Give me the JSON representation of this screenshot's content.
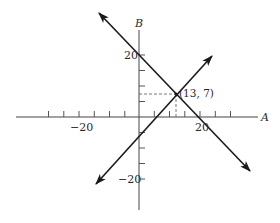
{
  "diagram": {
    "type": "coordinate-graph",
    "axes": {
      "horizontal": {
        "name": "A",
        "tick_step": 5,
        "labeled_ticks": [
          {
            "value": -20,
            "label": "−20"
          },
          {
            "value": 20,
            "label": "20"
          }
        ],
        "range": [
          -40,
          40
        ]
      },
      "vertical": {
        "name": "B",
        "tick_step": 5,
        "labeled_ticks": [
          {
            "value": 20,
            "label": "20"
          },
          {
            "value": -20,
            "label": "−20"
          }
        ],
        "range": [
          -30,
          35
        ]
      }
    },
    "lines": [
      {
        "name": "falling-line",
        "description": "A + B = 20",
        "through": [
          [
            0,
            20
          ],
          [
            20,
            0
          ]
        ],
        "arrows": "both"
      },
      {
        "name": "rising-line",
        "description": "A − B = 6",
        "through": [
          [
            0,
            -6
          ],
          [
            13,
            7
          ]
        ],
        "arrows": "both"
      }
    ],
    "intersection": {
      "point": [
        13,
        7
      ],
      "label": "(13, 7)"
    },
    "colors": {
      "line": "#1a1a1a",
      "axis": "#444444",
      "dashed": "#555555"
    }
  },
  "labels": {
    "axis_a": "A",
    "axis_b": "B",
    "tick_neg20_h": "−20",
    "tick_20_h": "20",
    "tick_20_v": "20",
    "tick_neg20_v": "−20",
    "intersection": "(13, 7)"
  }
}
